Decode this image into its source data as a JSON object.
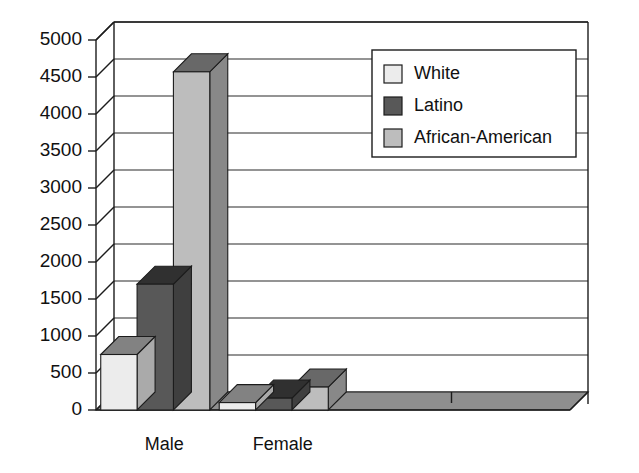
{
  "chart_data": {
    "type": "bar",
    "title": "",
    "subtitle": "",
    "xlabel": "",
    "ylabel": "",
    "categories": [
      "Male",
      "Female",
      "",
      ""
    ],
    "series": [
      {
        "name": "White",
        "color": "#ececec",
        "values": [
          750,
          100,
          0,
          0
        ]
      },
      {
        "name": "Latino",
        "color": "#585858",
        "values": [
          1700,
          160,
          0,
          0
        ]
      },
      {
        "name": "African-American",
        "color": "#bdbdbd",
        "values": [
          4570,
          310,
          0,
          0
        ]
      }
    ],
    "ylim": [
      0,
      5000
    ],
    "ytick_labels": [
      "0",
      "500",
      "1000",
      "1500",
      "2000",
      "2500",
      "3000",
      "3500",
      "4000",
      "4500",
      "5000"
    ],
    "ytick_values": [
      0,
      500,
      1000,
      1500,
      2000,
      2500,
      3000,
      3500,
      4000,
      4500,
      5000
    ],
    "grid": true,
    "grid_axis": "y",
    "legend_position": "top-right",
    "style": "3d-column",
    "background": "#ffffff",
    "axis_color": "#1c1c1c",
    "grid_color": "#2b2b2b",
    "floor_color": "#8f8f8f"
  },
  "legend": {
    "entries": [
      {
        "label": "White",
        "color": "#ececec"
      },
      {
        "label": "Latino",
        "color": "#585858"
      },
      {
        "label": "African-American",
        "color": "#bdbdbd"
      }
    ]
  },
  "axes": {
    "y_ticks": [
      {
        "label": "5000",
        "value": 5000
      },
      {
        "label": "4500",
        "value": 4500
      },
      {
        "label": "4000",
        "value": 4000
      },
      {
        "label": "3500",
        "value": 3500
      },
      {
        "label": "3000",
        "value": 3000
      },
      {
        "label": "2500",
        "value": 2500
      },
      {
        "label": "2000",
        "value": 2000
      },
      {
        "label": "1500",
        "value": 1500
      },
      {
        "label": "1000",
        "value": 1000
      },
      {
        "label": "500",
        "value": 500
      },
      {
        "label": "0",
        "value": 0
      }
    ],
    "x_categories": [
      {
        "label": "Male"
      },
      {
        "label": "Female"
      },
      {
        "label": ""
      },
      {
        "label": ""
      }
    ]
  }
}
